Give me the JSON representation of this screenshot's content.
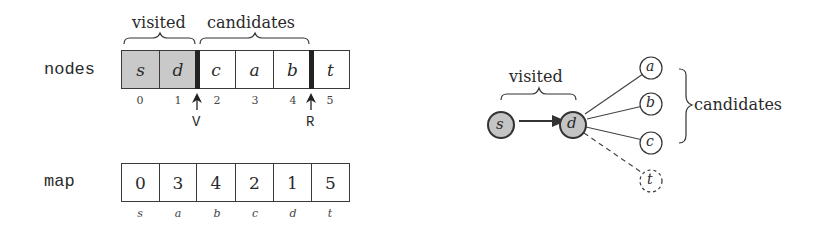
{
  "left": {
    "labels": {
      "visited": "visited",
      "candidates": "candidates"
    },
    "nodes": {
      "label": "nodes",
      "cells": [
        {
          "value": "s",
          "visited": true
        },
        {
          "value": "d",
          "visited": true
        },
        {
          "value": "c",
          "visited": false
        },
        {
          "value": "a",
          "visited": false
        },
        {
          "value": "b",
          "visited": false
        },
        {
          "value": "t",
          "visited": false
        }
      ],
      "indices": [
        "0",
        "1",
        "2",
        "3",
        "4",
        "5"
      ],
      "pointers": {
        "V": "V",
        "R": "R"
      }
    },
    "map": {
      "label": "map",
      "cells": [
        "0",
        "3",
        "4",
        "2",
        "1",
        "5"
      ],
      "keys": [
        "s",
        "a",
        "b",
        "c",
        "d",
        "t"
      ]
    }
  },
  "right": {
    "labels": {
      "visited": "visited",
      "candidates": "candidates"
    },
    "nodes": {
      "s": "s",
      "d": "d",
      "a": "a",
      "b": "b",
      "c": "c",
      "t": "t"
    },
    "colors": {
      "visited_fill": "#c4c4c4",
      "stroke": "#333333"
    }
  }
}
